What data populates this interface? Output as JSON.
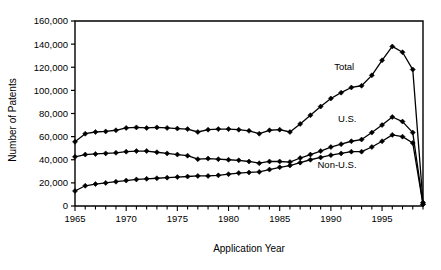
{
  "chart_data": {
    "type": "line",
    "title": "",
    "xlabel": "Application Year",
    "ylabel": "Number of Patents",
    "xlim": [
      1965,
      1999
    ],
    "ylim": [
      0,
      160000
    ],
    "ytick_step": 20000,
    "xtick_step": 1,
    "xtick_label_step": 5,
    "grid": false,
    "legend": "inline-labels",
    "marker": "filled-diamond",
    "x": [
      1965,
      1966,
      1967,
      1968,
      1969,
      1970,
      1971,
      1972,
      1973,
      1974,
      1975,
      1976,
      1977,
      1978,
      1979,
      1980,
      1981,
      1982,
      1983,
      1984,
      1985,
      1986,
      1987,
      1988,
      1989,
      1990,
      1991,
      1992,
      1993,
      1994,
      1995,
      1996,
      1997,
      1998,
      1999
    ],
    "xtick_labels": [
      "1965",
      "1970",
      "1975",
      "1980",
      "1985",
      "1990",
      "1995"
    ],
    "xtick_label_values": [
      1965,
      1970,
      1975,
      1980,
      1985,
      1990,
      1995
    ],
    "ytick_labels": [
      "0",
      "20,000",
      "40,000",
      "60,000",
      "80,000",
      "100,000",
      "120,000",
      "140,000",
      "160,000"
    ],
    "ytick_values": [
      0,
      20000,
      40000,
      60000,
      80000,
      100000,
      120000,
      140000,
      160000
    ],
    "series": [
      {
        "name": "Total",
        "label": "Total",
        "label_x": 1991.3,
        "label_y": 118000,
        "values": [
          55500,
          62500,
          64000,
          64500,
          65500,
          67500,
          68000,
          67500,
          68000,
          67500,
          67000,
          66500,
          64000,
          66000,
          66500,
          66500,
          66000,
          65000,
          62500,
          65500,
          66000,
          64000,
          71000,
          78500,
          86000,
          93000,
          98000,
          102500,
          104000,
          113000,
          126000,
          138000,
          133000,
          118000,
          3000
        ]
      },
      {
        "name": "U.S.",
        "label": "U.S.",
        "label_x": 1991.6,
        "label_y": 72500,
        "values": [
          42500,
          44500,
          45000,
          45500,
          46000,
          47000,
          47500,
          47500,
          46500,
          45500,
          44500,
          43500,
          40500,
          41000,
          40500,
          40000,
          39500,
          38500,
          37000,
          38500,
          38500,
          38000,
          41500,
          44500,
          47500,
          51000,
          53500,
          56000,
          57500,
          63500,
          70000,
          77000,
          73000,
          63500,
          1500
        ]
      },
      {
        "name": "Non-U.S.",
        "label": "Non-U.S.",
        "label_x": 1990.6,
        "label_y": 33000,
        "values": [
          13000,
          17500,
          19000,
          20000,
          21000,
          22000,
          23000,
          23500,
          24000,
          24500,
          25000,
          25500,
          26000,
          26000,
          26500,
          27500,
          28500,
          29000,
          29500,
          31500,
          33500,
          35000,
          37500,
          40000,
          42000,
          44000,
          45500,
          47000,
          47000,
          51000,
          56000,
          61500,
          60000,
          54500,
          1500
        ]
      }
    ]
  }
}
